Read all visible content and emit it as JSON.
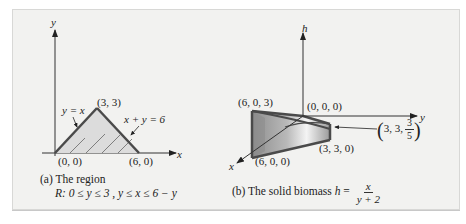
{
  "figure_a": {
    "axis_x_label": "x",
    "axis_y_label": "y",
    "points": {
      "origin": "(0, 0)",
      "apex": "(3, 3)",
      "right": "(6, 0)"
    },
    "line_labels": {
      "left_edge": "y = x",
      "right_edge": "x + y = 6"
    },
    "caption_line1": "(a) The region",
    "caption_line2_prefix": "R",
    "caption_line2_rest": ": 0 ≤ y ≤ 3 , y ≤ x ≤ 6 − y"
  },
  "figure_b": {
    "axis_h_label": "h",
    "axis_y_label": "y",
    "axis_x_label": "x",
    "points": {
      "top_left": "(6, 0, 3)",
      "origin": "(0, 0, 0)",
      "bottom_left": "(6, 0, 0)",
      "bottom_right": "(3, 3, 0)",
      "callout_prefix": "3, 3,",
      "callout_num": "3",
      "callout_den": "5"
    },
    "caption_prefix": "(b) The solid biomass ",
    "caption_var": "h",
    "caption_eq": " = ",
    "caption_num": "x",
    "caption_den": "y + 2"
  },
  "colors": {
    "panel_bg": "#f2f2f0",
    "shade_fill": "#d9d9d9",
    "edge": "#4a4a4a",
    "axis": "#333333"
  }
}
